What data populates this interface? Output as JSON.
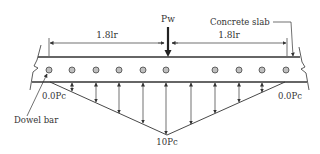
{
  "diagram": {
    "load_label": "Pw",
    "slab_label": "Concrete slab",
    "dowel_label": "Dowel bar",
    "left_span_label": "1.8lr",
    "right_span_label": "1.8lr",
    "left_edge_value": "0.0Pc",
    "right_edge_value": "0.0Pc",
    "peak_value": "10Pc",
    "colors": {
      "line": "#333333",
      "dowel_fill": "#bfbfbf",
      "background": "#ffffff"
    }
  }
}
